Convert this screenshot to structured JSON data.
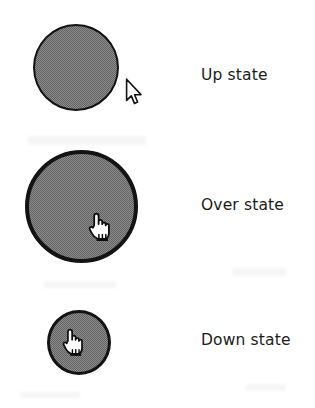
{
  "figure": {
    "background_color": "#ffffff",
    "ink_color": "#131313",
    "fill_color": "#8d8d8d"
  },
  "states": [
    {
      "id": "up",
      "label": "Up state",
      "shape": "circle",
      "diameter_px": 86,
      "border_px": 2,
      "cursor": "arrow-pointer-cursor"
    },
    {
      "id": "over",
      "label": "Over state",
      "shape": "circle",
      "diameter_px": 113,
      "border_px": 4,
      "cursor": "pointing-hand-cursor"
    },
    {
      "id": "down",
      "label": "Down state",
      "shape": "circle",
      "diameter_px": 64,
      "border_px": 3,
      "cursor": "pointing-hand-cursor"
    }
  ]
}
